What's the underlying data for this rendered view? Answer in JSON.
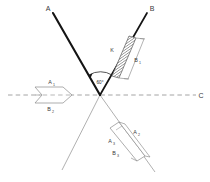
{
  "figure": {
    "background_color": "#ffffff",
    "width": 210,
    "height": 182,
    "ray_color_thick": "#1a1a1a",
    "ray_color_thin": "#8a8a8a",
    "dashed_color": "#9a9a9a",
    "outline_color": "#8a8a8a",
    "hatch_color": "#555555",
    "label_color": "#3a3a3a"
  },
  "labels": {
    "axis_a": "A",
    "axis_b": "B",
    "axis_c": "C",
    "angle": "60°",
    "plane_k": "K",
    "plane_b1": "B",
    "plane_b1_idx": "1",
    "plane_a1": "A",
    "plane_a1_idx": "1",
    "plane_b2": "B",
    "plane_b2_idx": "2",
    "plane_a2": "A",
    "plane_a2_idx": "2",
    "plane_a3": "A",
    "plane_a3_idx": "3",
    "plane_b3": "B",
    "plane_b3_idx": "3"
  },
  "geometry": {
    "vertex_x": 100,
    "vertex_y": 95,
    "ray_a_end_x": 52,
    "ray_a_end_y": 12,
    "ray_b_end_x": 148,
    "ray_b_end_y": 12,
    "ray_down_left_end_x": 62,
    "ray_down_left_end_y": 170,
    "ray_down_right_end_x": 155,
    "ray_down_right_end_y": 172,
    "dashed_start_x": 8,
    "dashed_end_x": 196,
    "dashed_y": 95,
    "angle_degrees": 60
  },
  "shapes": {
    "hatched_plane": {
      "name": "hatched-band-upper-right",
      "hatch_spacing": 2.0
    },
    "chevron_plane": {
      "name": "chevron-band-left"
    },
    "lower_plane": {
      "name": "parallelogram-band-lower-right"
    }
  }
}
